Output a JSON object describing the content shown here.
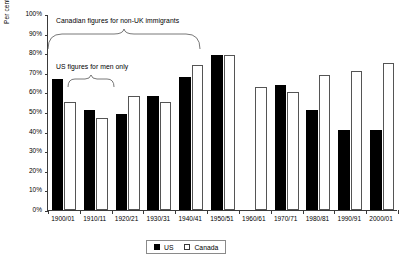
{
  "chart_data": {
    "type": "bar",
    "title": "",
    "xlabel": "",
    "ylabel": "Per cent naturalised",
    "ylim": [
      0,
      100
    ],
    "ytick_labels": [
      "100%",
      "90%",
      "80%",
      "70%",
      "60%",
      "50%",
      "40%",
      "30%",
      "20%",
      "10%",
      "0%"
    ],
    "ytick_values": [
      100,
      90,
      80,
      70,
      60,
      50,
      40,
      30,
      20,
      10,
      0
    ],
    "grid": false,
    "legend_position": "bottom-center",
    "categories": [
      "1900/01",
      "1910/11",
      "1920/21",
      "1930/31",
      "1940/41",
      "1950/51",
      "1960/61",
      "1970/71",
      "1980/81",
      "1990/91",
      "2000/01"
    ],
    "series": [
      {
        "name": "US",
        "color": "#000000",
        "values": [
          67,
          51,
          49,
          58,
          68,
          79,
          null,
          64,
          51,
          41,
          41
        ]
      },
      {
        "name": "Canada",
        "color": "#ffffff",
        "values": [
          55,
          47,
          58,
          55,
          74,
          79,
          63,
          60,
          69,
          71,
          75
        ]
      }
    ],
    "annotations": [
      {
        "text": "Canadian figures for non-UK immigrants",
        "brace_from": "1900/01",
        "brace_to": "1940/41"
      },
      {
        "text": "US figures for men only",
        "brace_from": "1910/11",
        "brace_to": "1920/21"
      }
    ]
  },
  "legend": {
    "items": [
      {
        "label": "US",
        "swatch": "filled-square-icon"
      },
      {
        "label": "Canada",
        "swatch": "outlined-square-icon"
      }
    ]
  }
}
